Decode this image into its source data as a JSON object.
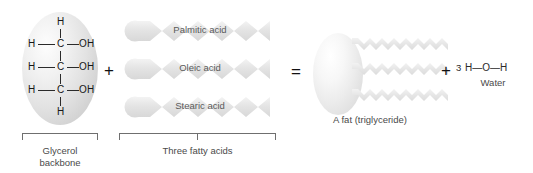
{
  "diagram": {
    "background_color": "#ffffff"
  },
  "glycerol": {
    "caption": "Glycerol\nbackbone",
    "formula_rows": [
      {
        "left": "H",
        "center": "",
        "right": ""
      },
      {
        "left": "H",
        "center": "C",
        "right": "OH"
      },
      {
        "left": "H",
        "center": "C",
        "right": "OH"
      },
      {
        "left": "H",
        "center": "C",
        "right": "OH"
      },
      {
        "left": "H",
        "center": "",
        "right": ""
      }
    ],
    "atoms": {
      "h_top": "H",
      "h_left_1": "H",
      "c_1": "C",
      "oh_1": "OH",
      "h_left_2": "H",
      "c_2": "C",
      "oh_2": "OH",
      "h_left_3": "H",
      "c_3": "C",
      "oh_3": "OH",
      "h_bottom": "H"
    }
  },
  "operators": {
    "plus_1": "+",
    "equals": "=",
    "plus_2": "+"
  },
  "fatty_acids": {
    "caption": "Three fatty acids",
    "chains": [
      {
        "label": "Palmitic acid"
      },
      {
        "label": "Oleic acid"
      },
      {
        "label": "Stearic acid"
      }
    ]
  },
  "fat": {
    "caption": "A fat (triglyceride)",
    "tail_count": 3
  },
  "water": {
    "coefficient": "3",
    "formula": "H—O—H",
    "caption": "Water"
  },
  "colors": {
    "molecule_gray": "#e2e2e2",
    "chain_gray": "#e6e6e6",
    "text_dark": "#1b1b1b",
    "text_gray": "#4a4a4a",
    "bracket_gray": "#6f6f6f"
  }
}
